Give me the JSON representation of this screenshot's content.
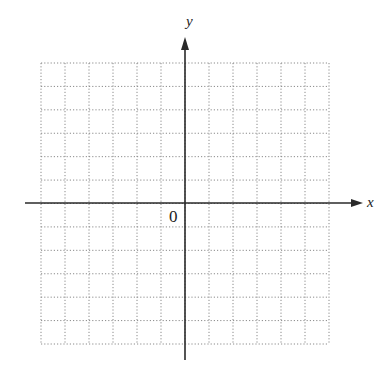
{
  "chart_data": {
    "type": "grid",
    "title": "",
    "xlabel": "x",
    "ylabel": "y",
    "origin_label": "0",
    "grid": {
      "columns": 12,
      "rows": 12,
      "line_style": "dotted",
      "x_range": [
        -6,
        6
      ],
      "y_range": [
        -6,
        6
      ]
    },
    "axes": {
      "x_arrow": true,
      "y_arrow": true
    }
  },
  "labels": {
    "x_axis": "x",
    "y_axis": "y",
    "origin": "0"
  },
  "colors": {
    "grid": "#8a8a8a",
    "axis": "#2a2a2a",
    "background": "#ffffff"
  }
}
